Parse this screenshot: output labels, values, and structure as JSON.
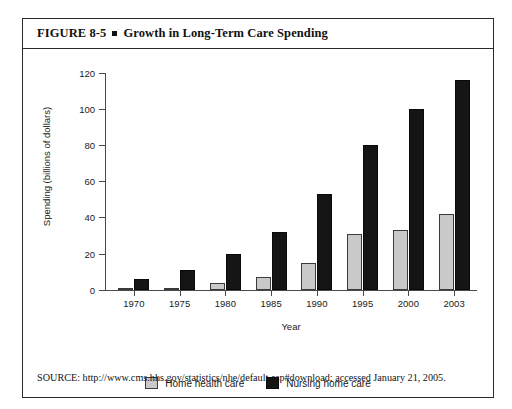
{
  "figure": {
    "number_label": "FIGURE 8-5",
    "bullet_icon": "square-bullet-icon",
    "title": "Growth in Long-Term Care Spending",
    "source_note": "SOURCE: http://www.cms.hhs.gov/statistics/nhe/default.asp#download; accessed January 21, 2005."
  },
  "colors": {
    "home_health_care": "#c9c9c9",
    "nursing_home_care": "#151515",
    "axis": "#4a4a4a",
    "border": "#2b2b2b",
    "text": "#1a1a1a"
  },
  "chart_data": {
    "type": "bar",
    "title": "Growth in Long-Term Care Spending",
    "xlabel": "Year",
    "ylabel": "Spending (billions of dollars)",
    "categories": [
      "1970",
      "1975",
      "1980",
      "1985",
      "1990",
      "1995",
      "2000",
      "2003"
    ],
    "series": [
      {
        "name": "Home health care",
        "color": "#c9c9c9",
        "values": [
          0,
          0.5,
          3.5,
          7,
          15,
          31,
          33,
          42
        ]
      },
      {
        "name": "Nursing home care",
        "color": "#151515",
        "values": [
          6,
          11,
          20,
          32,
          53,
          80,
          100,
          116
        ]
      }
    ],
    "ylim": [
      0,
      120
    ],
    "yticks": [
      0,
      20,
      40,
      60,
      80,
      100,
      120
    ],
    "ytick_labels": [
      "0",
      "20",
      "40",
      "60",
      "80",
      "100",
      "120"
    ],
    "grid": false,
    "legend_position": "bottom-center",
    "legend_entries": [
      "Home health care",
      "Nursing home care"
    ]
  }
}
